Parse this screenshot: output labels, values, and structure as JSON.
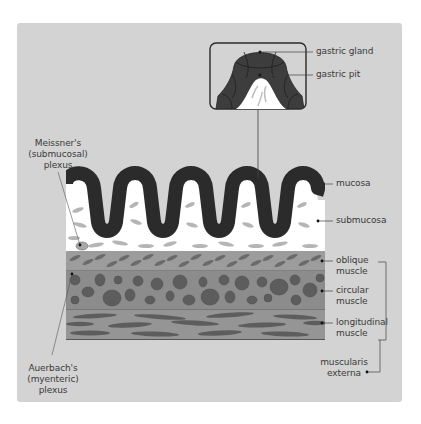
{
  "figure": {
    "type": "anatomical-diagram",
    "colors": {
      "panel_bg": "#d3d3d3",
      "mucosa": "#2b2b2b",
      "submucosa": "#ffffff",
      "submucosa_streaks": "#b5b5b5",
      "oblique_layer": "#9c9c9c",
      "circular_layer": "#8c8c8c",
      "longitudinal_layer": "#959595",
      "fiber_blobs": "#5d5d5d",
      "lines": "#444444"
    }
  },
  "labels": {
    "left": {
      "meissner": [
        "Meissner's",
        "(submucosal)",
        "plexus"
      ],
      "auerbach": [
        "Auerbach's",
        "(myenteric)",
        "plexus"
      ]
    },
    "inset": {
      "gastric_gland": "gastric gland",
      "gastric_pit": "gastric pit"
    },
    "right": {
      "mucosa": "mucosa",
      "submucosa": "submucosa",
      "oblique": [
        "oblique",
        "muscle"
      ],
      "circular": [
        "circular",
        "muscle"
      ],
      "longitudinal": [
        "longitudinal",
        "muscle"
      ],
      "muscularis": [
        "muscularis",
        "externa"
      ]
    }
  }
}
